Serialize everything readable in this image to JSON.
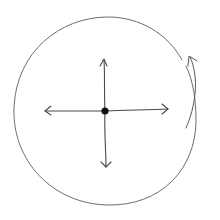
{
  "diagram": {
    "type": "hand-drawn sketch",
    "colors": {
      "background": "#ffffff",
      "circle_stroke": "#6e6e6e",
      "arrow_stroke": "#4a4a4a",
      "center_dot": "#111111"
    },
    "elements": {
      "outer_circle": {
        "center": [
          104,
          111
        ],
        "rx": 89,
        "ry": 94
      },
      "center_dot": {
        "center": [
          105,
          111
        ],
        "radius": 3.5
      },
      "arrows": [
        {
          "direction": "up",
          "tip": [
            104,
            59
          ]
        },
        {
          "direction": "down",
          "tip": [
            106,
            167
          ]
        },
        {
          "direction": "left",
          "tip": [
            45,
            111
          ]
        },
        {
          "direction": "right",
          "tip": [
            168,
            109
          ]
        }
      ],
      "rotation_arrow": {
        "direction": "counterclockwise",
        "from": [
          186,
          128
        ],
        "to": [
          190,
          57
        ]
      }
    }
  }
}
